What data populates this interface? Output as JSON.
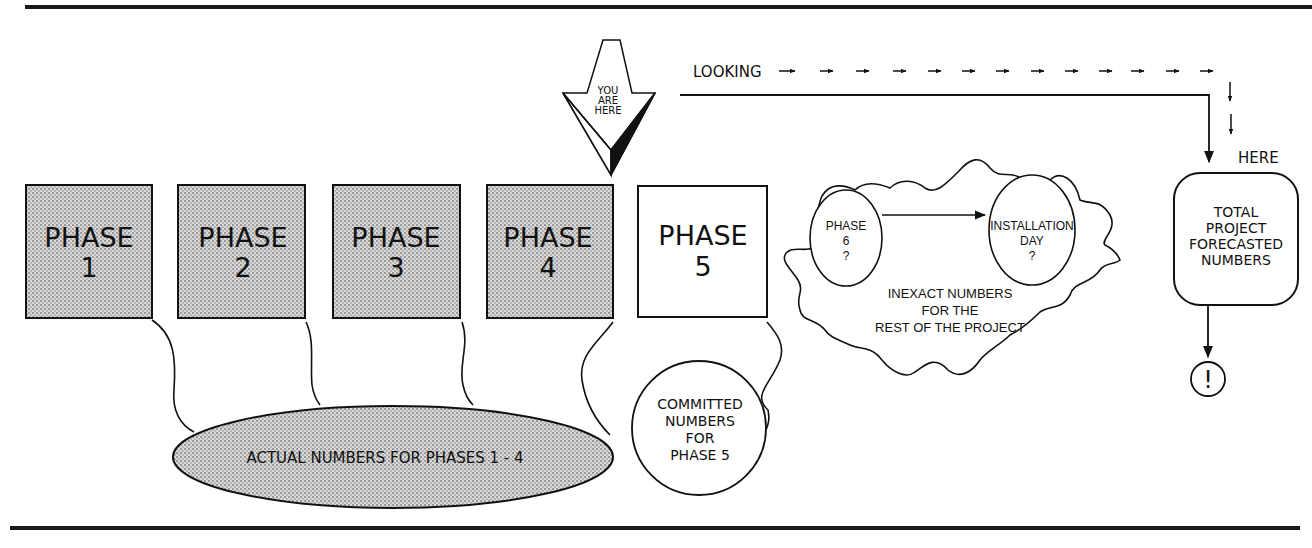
{
  "figure": {
    "top_rule": true,
    "bottom_rule": true
  },
  "you_are_here": {
    "lines": [
      "YOU",
      "ARE",
      "HERE"
    ]
  },
  "looking": {
    "label": "LOOKING",
    "arrow_glyph": "→",
    "dashed_arrow_count": 11,
    "down_arrow_count": 2,
    "target_label": "HERE"
  },
  "phases": [
    {
      "label": "PHASE",
      "number": "1",
      "status": "completed",
      "fill": "#c8c8c8"
    },
    {
      "label": "PHASE",
      "number": "2",
      "status": "completed",
      "fill": "#c8c8c8"
    },
    {
      "label": "PHASE",
      "number": "3",
      "status": "completed",
      "fill": "#c8c8c8"
    },
    {
      "label": "PHASE",
      "number": "4",
      "status": "completed",
      "fill": "#c8c8c8"
    },
    {
      "label": "PHASE",
      "number": "5",
      "status": "current",
      "fill": "#ffffff"
    }
  ],
  "actual_numbers": {
    "text": "ACTUAL NUMBERS FOR PHASES 1 - 4"
  },
  "committed_numbers": {
    "lines": [
      "COMMITTED",
      "NUMBERS",
      "FOR",
      "PHASE  5"
    ]
  },
  "cloud": {
    "phase6": {
      "lines": [
        "PHASE",
        "6",
        "?"
      ]
    },
    "installation": {
      "lines": [
        "INSTALLATION",
        "DAY",
        "?"
      ]
    },
    "caption_lines": [
      "INEXACT NUMBERS",
      "FOR THE",
      "REST OF THE PROJECT"
    ]
  },
  "total": {
    "lines": [
      "TOTAL",
      "PROJECT",
      "FORECASTED",
      "NUMBERS"
    ]
  },
  "alert": {
    "glyph": "!"
  },
  "colors": {
    "ink": "#111111",
    "shade": "#c8c8c8",
    "background": "#ffffff"
  }
}
